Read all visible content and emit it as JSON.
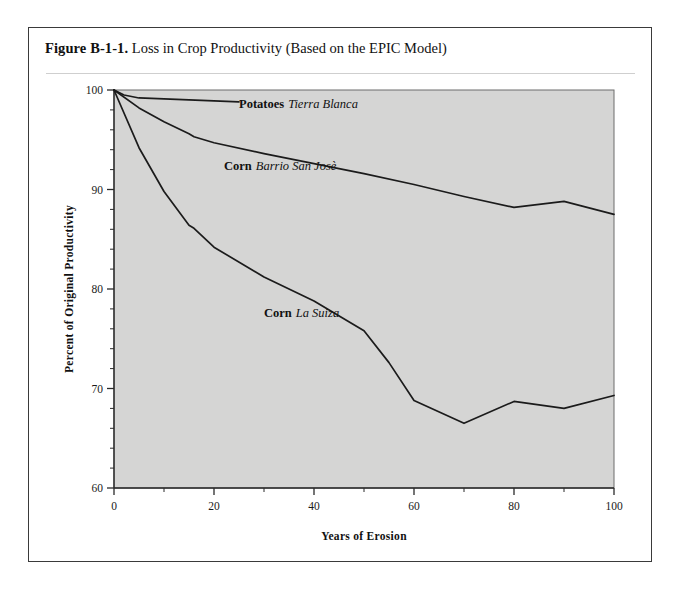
{
  "figure": {
    "number": "Figure B-1-1.",
    "caption": "Loss in Crop Productivity  (Based on the EPIC Model)"
  },
  "colors": {
    "plot_background": "#d5d5d4",
    "line": "#1b1b1b",
    "frame": "#3a3a3a",
    "rule": "#cfcfcf"
  },
  "chart_data": {
    "type": "line",
    "title": "Loss in Crop Productivity (Based on the EPIC Model)",
    "xlabel": "Years of Erosion",
    "ylabel": "Percent of Original  Productivity",
    "xlim": [
      0,
      100
    ],
    "ylim": [
      60,
      100
    ],
    "xticks": [
      0,
      20,
      40,
      60,
      80,
      100
    ],
    "xticklabels": [
      "0",
      "20",
      "40",
      "60",
      "80",
      "100"
    ],
    "x_minor_step": 10,
    "yticks": [
      60,
      70,
      80,
      90,
      100
    ],
    "yticklabels": [
      "60",
      "70",
      "80",
      "90",
      "100"
    ],
    "y_minor_step": 2,
    "grid": false,
    "legend": "inline-annotations",
    "series": [
      {
        "name": "Potatoes Tierra Blanca",
        "crop": "Potatoes",
        "site": "Tierra Blanca",
        "label_x": 25,
        "label_y": 98.2,
        "x": [
          0,
          2,
          5,
          10,
          15,
          20,
          25
        ],
        "y": [
          100,
          99.5,
          99.2,
          99.1,
          99.0,
          98.9,
          98.8
        ]
      },
      {
        "name": "Corn Barrio San Josè",
        "crop": "Corn",
        "site": "Barrio San Josè",
        "label_x": 22,
        "label_y": 92.0,
        "x": [
          0,
          5,
          10,
          15,
          16,
          20,
          30,
          40,
          50,
          60,
          70,
          80,
          90,
          100
        ],
        "y": [
          100,
          98.2,
          96.8,
          95.6,
          95.3,
          94.7,
          93.6,
          92.6,
          91.6,
          90.5,
          89.3,
          88.2,
          88.8,
          87.5
        ]
      },
      {
        "name": "Corn La Suiza",
        "crop": "Corn",
        "site": "La Suiza",
        "label_x": 30,
        "label_y": 77.2,
        "x": [
          0,
          5,
          10,
          15,
          16,
          20,
          30,
          40,
          50,
          55,
          60,
          70,
          80,
          90,
          100
        ],
        "y": [
          100,
          94.2,
          89.8,
          86.4,
          86.1,
          84.2,
          81.2,
          78.8,
          75.8,
          72.6,
          68.8,
          66.5,
          68.7,
          68.0,
          69.3
        ]
      }
    ]
  }
}
